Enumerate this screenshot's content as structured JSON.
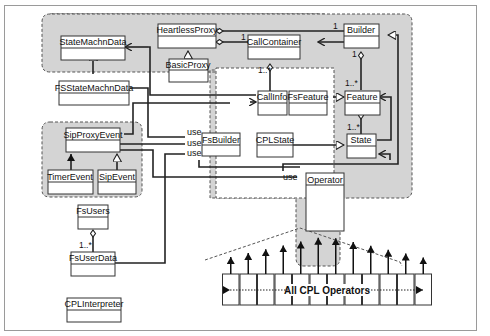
{
  "diagram": {
    "classes": {
      "state_machn_data": "StateMachnData",
      "heartless_proxy": "HeartlessProxy",
      "basic_proxy": "BasicProxy",
      "call_container": "CallContainer",
      "builder": "Builder",
      "fs_state_machn_data": "FSStateMachnData",
      "call_info": "CallInfo",
      "fs_feature": "FsFeature",
      "feature": "Feature",
      "sip_proxy_event": "SipProxyEvent",
      "fs_builder": "FsBuilder",
      "cpl_state": "CPLState",
      "state": "State",
      "timer_event": "TimerEvent",
      "sip_event": "SipEvent",
      "operator": "Operator",
      "fs_users": "FsUsers",
      "fs_user_data": "FsUserData",
      "cpl_interpreter": "CPLInterpreter"
    },
    "labels": {
      "use": "use",
      "one": "1",
      "one_many": "1..*",
      "all_cpl_operators": "All CPL Operators"
    },
    "operator_count": 12
  }
}
